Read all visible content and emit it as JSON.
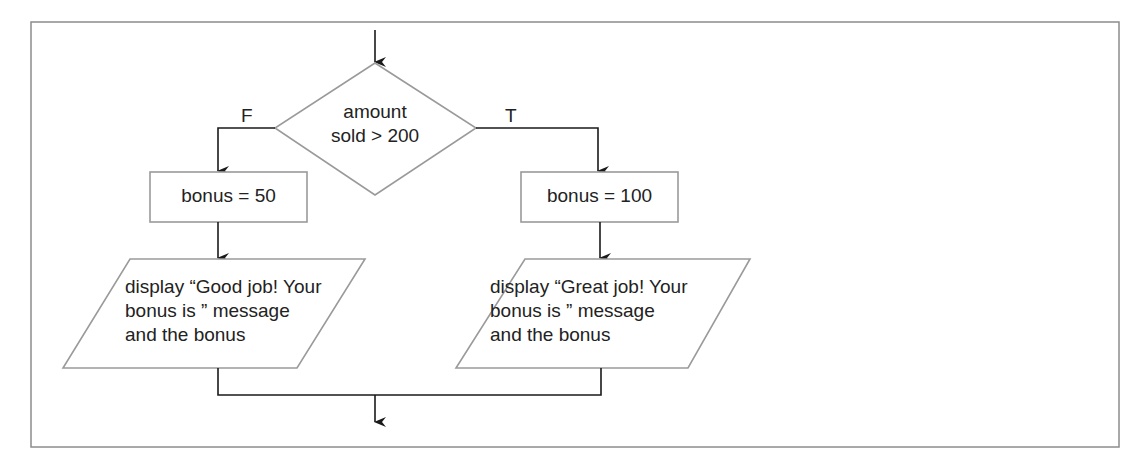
{
  "diagram": {
    "type": "flowchart",
    "colors": {
      "frame": "#8c8c8c",
      "shape_outline": "#9a9a9a",
      "connector": "#1a1a1a",
      "text": "#222222",
      "background": "#ffffff"
    },
    "decision": {
      "line1": "amount",
      "line2": "sold > 200"
    },
    "branches": {
      "false_label": "F",
      "true_label": "T"
    },
    "false_branch": {
      "process": "bonus = 50",
      "output": {
        "line1": "display “Good job! Your",
        "line2": "bonus is ” message",
        "line3": "and the bonus"
      }
    },
    "true_branch": {
      "process": "bonus = 100",
      "output": {
        "line1": "display “Great job! Your",
        "line2": "bonus is ” message",
        "line3": "and the bonus"
      }
    }
  }
}
